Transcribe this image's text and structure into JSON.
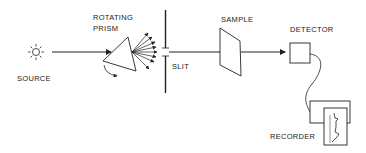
{
  "diagram": {
    "colors": {
      "ink": "#222222",
      "background": "#ffffff"
    },
    "labels": {
      "source": "SOURCE",
      "prism_line1": "ROTATING",
      "prism_line2": "PRISM",
      "slit": "SLIT",
      "sample": "SAMPLE",
      "detector": "DETECTOR",
      "recorder": "RECORDER"
    },
    "components": [
      {
        "id": "source",
        "icon": "sun-icon"
      },
      {
        "id": "prism",
        "icon": "triangle-prism-icon"
      },
      {
        "id": "slit",
        "icon": "slit-barrier"
      },
      {
        "id": "sample",
        "icon": "sample-cell"
      },
      {
        "id": "detector",
        "icon": "detector-box"
      },
      {
        "id": "recorder",
        "icon": "chart-recorder"
      }
    ],
    "flow": [
      "source",
      "prism",
      "slit",
      "sample",
      "detector",
      "recorder"
    ]
  }
}
